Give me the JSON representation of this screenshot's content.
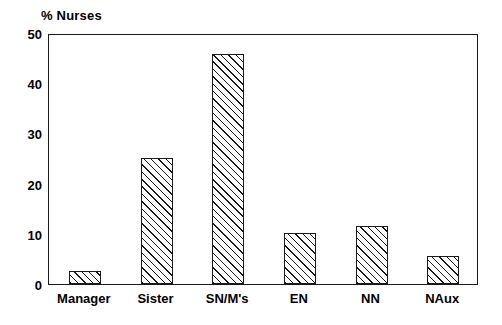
{
  "chart_data": {
    "type": "bar",
    "title": "% Nurses",
    "xlabel": "",
    "ylabel": "% Nurses",
    "categories": [
      "Manager",
      "Sister",
      "SN/M's",
      "EN",
      "NN",
      "NAux"
    ],
    "values": [
      2.6,
      25.2,
      45.8,
      10.2,
      11.6,
      5.6
    ],
    "series": [
      {
        "name": "% Nurses",
        "values": [
          2.6,
          25.2,
          45.8,
          10.2,
          11.6,
          5.6
        ]
      }
    ],
    "ylim": [
      0,
      50
    ],
    "yticks": [
      0,
      10,
      20,
      30,
      40,
      50
    ],
    "ytick_labels": [
      "0",
      "10",
      "20",
      "30",
      "40",
      "50"
    ],
    "grid": false,
    "legend": "none",
    "bar_fill": "diagonal-hatch",
    "bar_color": "#ffffff",
    "bar_edge_color": "#1a1a1a",
    "background_color": "#ffffff"
  },
  "axes": {
    "y_ticks": [
      {
        "label": "50",
        "value": 50
      },
      {
        "label": "40",
        "value": 40
      },
      {
        "label": "30",
        "value": 30
      },
      {
        "label": "20",
        "value": 20
      },
      {
        "label": "10",
        "value": 10
      },
      {
        "label": "0",
        "value": 0
      }
    ],
    "x_ticks": [
      {
        "label": "Manager"
      },
      {
        "label": "Sister"
      },
      {
        "label": "SN/M's"
      },
      {
        "label": "EN"
      },
      {
        "label": "NN"
      },
      {
        "label": "NAux"
      }
    ]
  }
}
